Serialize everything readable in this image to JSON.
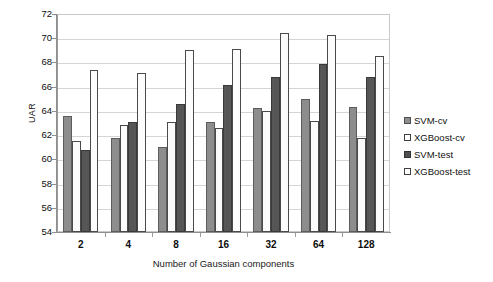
{
  "chart_data": {
    "type": "bar",
    "title": "",
    "xlabel": "Number of Gaussian components",
    "ylabel": "UAR",
    "categories": [
      "2",
      "4",
      "8",
      "16",
      "32",
      "64",
      "128"
    ],
    "series": [
      {
        "name": "SVM-cv",
        "color": "#8d8d8d",
        "values": [
          63.6,
          61.8,
          61.0,
          63.1,
          64.2,
          65.0,
          64.3
        ]
      },
      {
        "name": "XGBoost-cv",
        "color": "#ffffff",
        "values": [
          61.5,
          62.8,
          63.1,
          62.6,
          64.0,
          63.2,
          61.8
        ]
      },
      {
        "name": "SVM-test",
        "color": "#565656",
        "values": [
          60.8,
          63.1,
          64.6,
          66.1,
          66.8,
          67.9,
          66.8
        ]
      },
      {
        "name": "XGBoost-test",
        "color": "#ffffff",
        "values": [
          67.4,
          67.1,
          69.0,
          69.1,
          70.4,
          70.3,
          68.5
        ]
      }
    ],
    "ylim": [
      54,
      72
    ],
    "ytick_step": 2,
    "yticks": [
      "72",
      "70",
      "68",
      "66",
      "64",
      "62",
      "60",
      "58",
      "56",
      "54"
    ],
    "grid": true,
    "legend_position": "right",
    "legend": [
      "SVM-cv",
      "XGBoost-cv",
      "SVM-test",
      "XGBoost-test"
    ]
  }
}
